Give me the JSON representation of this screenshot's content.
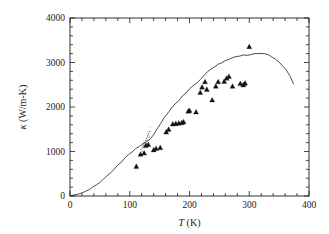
{
  "figure": {
    "background": "#ffffff",
    "ink_color": "#1a1a1a",
    "curve_color": "#2a2a2a",
    "marker_color": "#111111"
  },
  "axes": {
    "x": {
      "label_main": "T",
      "label_unit": " (K)",
      "label_full": "T (K)",
      "min": 0,
      "max": 400,
      "major_ticks": [
        0,
        100,
        200,
        300,
        400
      ],
      "tick_labels": [
        "0",
        "100",
        "200",
        "300",
        "400"
      ],
      "minor_tick_step": 20
    },
    "y": {
      "label_symbol": "κ",
      "label_unit": " (W/m-K)",
      "label_full": "κ (W/m-K)",
      "min": 0,
      "max": 4000,
      "major_ticks": [
        0,
        1000,
        2000,
        3000,
        4000
      ],
      "tick_labels": [
        "0",
        "1000",
        "2000",
        "3000",
        "4000"
      ],
      "minor_tick_step": 200
    }
  },
  "chart_data": {
    "type": "scatter",
    "title": "",
    "xlabel": "T (K)",
    "ylabel": "κ (W/m-K)",
    "xlim": [
      0,
      400
    ],
    "ylim": [
      0,
      4000
    ],
    "grid": false,
    "legend": "none",
    "series": [
      {
        "name": "model curve",
        "style": "solid-line",
        "x": [
          2,
          8,
          14,
          20,
          26,
          32,
          38,
          44,
          50,
          56,
          62,
          68,
          74,
          80,
          86,
          92,
          98,
          104,
          110,
          116,
          122,
          128,
          134,
          140,
          146,
          152,
          158,
          164,
          170,
          176,
          182,
          188,
          194,
          200,
          206,
          212,
          218,
          224,
          230,
          236,
          242,
          248,
          254,
          260,
          266,
          272,
          278,
          284,
          290,
          296,
          302,
          308,
          314,
          320,
          326,
          332,
          338,
          344,
          350,
          356,
          362,
          368,
          374
        ],
        "y": [
          10,
          25,
          45,
          70,
          105,
          145,
          195,
          250,
          315,
          385,
          455,
          530,
          610,
          690,
          770,
          850,
          925,
          1000,
          1060,
          1110,
          1160,
          1210,
          1280,
          1390,
          1520,
          1640,
          1760,
          1870,
          1975,
          2065,
          2150,
          2235,
          2320,
          2400,
          2470,
          2540,
          2620,
          2715,
          2800,
          2860,
          2905,
          2950,
          2990,
          3035,
          3075,
          3105,
          3130,
          3150,
          3165,
          3170,
          3175,
          3190,
          3200,
          3205,
          3195,
          3170,
          3130,
          3075,
          3005,
          2925,
          2830,
          2700,
          2520
        ]
      },
      {
        "name": "dotted branch",
        "style": "dotted",
        "x": [
          119,
          121,
          123,
          125,
          127,
          129,
          131,
          133,
          135
        ],
        "y": [
          1040,
          1090,
          1140,
          1200,
          1260,
          1320,
          1380,
          1435,
          1490
        ]
      },
      {
        "name": "experimental data",
        "style": "filled-triangle",
        "x": [
          111,
          118,
          124,
          127,
          131,
          140,
          144,
          151,
          161,
          165,
          172,
          177,
          182,
          187,
          190,
          198,
          200,
          211,
          218,
          221,
          226,
          229,
          238,
          244,
          248,
          258,
          262,
          266,
          272,
          285,
          290,
          293,
          300
        ],
        "y": [
          660,
          930,
          960,
          1130,
          1150,
          1030,
          1060,
          1080,
          1430,
          1490,
          1610,
          1620,
          1630,
          1640,
          1660,
          1900,
          1915,
          1880,
          2320,
          2440,
          2560,
          2390,
          2150,
          2460,
          2560,
          2570,
          2640,
          2680,
          2460,
          2520,
          2490,
          2530,
          3350
        ]
      }
    ]
  }
}
